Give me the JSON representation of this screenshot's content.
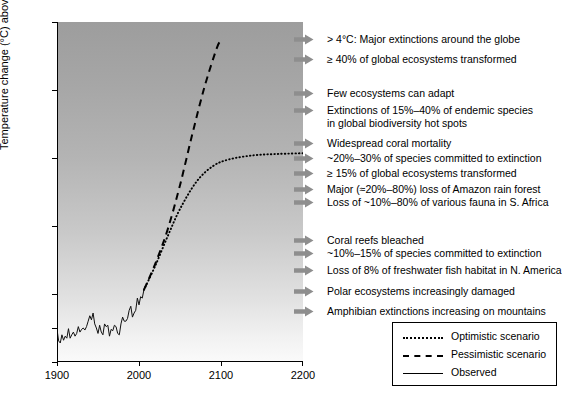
{
  "chart_data": {
    "type": "line",
    "title": "",
    "xlabel": "",
    "ylabel": "Temperature change (°C) above preindustrial",
    "xlim": [
      1900,
      2200
    ],
    "ylim": [
      -0.5,
      4.5
    ],
    "xticks": [
      "1900",
      "2000",
      "2100",
      "2200"
    ],
    "xtick_values": [
      1900,
      2000,
      2100,
      2200
    ],
    "yticks": [
      "−0.5",
      "0.0",
      "0.5",
      "1.5",
      "2.5",
      "3.5",
      "4.5"
    ],
    "ytick_values": [
      -0.5,
      0.0,
      0.5,
      1.5,
      2.5,
      3.5,
      4.5
    ],
    "grid": false,
    "legend_position": "bottom-right",
    "background": "vertical gradient, dark gray at top to white at bottom",
    "series": [
      {
        "name": "Observed",
        "style": "solid",
        "x": [
          1900,
          1902,
          1904,
          1906,
          1908,
          1910,
          1912,
          1914,
          1916,
          1918,
          1920,
          1922,
          1924,
          1926,
          1928,
          1930,
          1932,
          1934,
          1936,
          1938,
          1940,
          1942,
          1944,
          1946,
          1948,
          1950,
          1952,
          1954,
          1956,
          1958,
          1960,
          1962,
          1964,
          1966,
          1968,
          1970,
          1972,
          1974,
          1976,
          1978,
          1980,
          1982,
          1984,
          1986,
          1988,
          1990,
          1992,
          1994,
          1996,
          1998,
          2000,
          2002,
          2004,
          2006
        ],
        "values": [
          -0.02,
          -0.19,
          -0.22,
          -0.1,
          -0.18,
          -0.12,
          -0.15,
          -0.01,
          -0.15,
          -0.1,
          -0.06,
          -0.12,
          -0.08,
          0.02,
          -0.06,
          -0.02,
          0.0,
          -0.03,
          0.02,
          0.1,
          0.18,
          0.12,
          0.22,
          0.06,
          0.0,
          -0.08,
          0.04,
          -0.06,
          -0.1,
          0.06,
          0.02,
          0.04,
          -0.12,
          -0.02,
          -0.04,
          0.04,
          0.02,
          -0.08,
          -0.1,
          0.06,
          0.16,
          0.1,
          0.1,
          0.14,
          0.26,
          0.32,
          0.16,
          0.22,
          0.26,
          0.44,
          0.34,
          0.46,
          0.44,
          0.56
        ]
      },
      {
        "name": "Pessimistic scenario",
        "style": "dashed",
        "x": [
          2006,
          2020,
          2035,
          2050,
          2065,
          2080,
          2095,
          2100
        ],
        "values": [
          0.56,
          0.95,
          1.45,
          2.1,
          2.85,
          3.55,
          4.12,
          4.22
        ]
      },
      {
        "name": "Optimistic scenario",
        "style": "dotted",
        "x": [
          2006,
          2020,
          2035,
          2050,
          2070,
          2090,
          2110,
          2140,
          2170,
          2200
        ],
        "values": [
          0.56,
          0.92,
          1.35,
          1.75,
          2.15,
          2.38,
          2.48,
          2.54,
          2.56,
          2.57
        ]
      }
    ]
  },
  "yaxis": {
    "title": "Temperature change (°C) above preindustrial",
    "ticks": [
      {
        "label": "4.5",
        "value": 4.5
      },
      {
        "label": "3.5",
        "value": 3.5
      },
      {
        "label": "2.5",
        "value": 2.5
      },
      {
        "label": "1.5",
        "value": 1.5
      },
      {
        "label": "0.5",
        "value": 0.5
      },
      {
        "label": "0.0",
        "value": 0.0
      },
      {
        "label": "−0.5",
        "value": -0.5
      }
    ]
  },
  "xaxis": {
    "ticks": [
      {
        "label": "1900",
        "value": 1900
      },
      {
        "label": "2000",
        "value": 2000
      },
      {
        "label": "2100",
        "value": 2100
      },
      {
        "label": "2200",
        "value": 2200
      }
    ]
  },
  "annotations": [
    {
      "lines": [
        "> 4°C: Major extinctions around the globe"
      ],
      "temp": 4.25
    },
    {
      "lines": [
        "≥ 40% of global ecosystems transformed"
      ],
      "temp": 3.95
    },
    {
      "lines": [
        "Few ecosystems can adapt"
      ],
      "temp": 3.45
    },
    {
      "lines": [
        "Extinctions of 15%–40% of endemic species",
        "in global biodiversity hot spots"
      ],
      "temp": 3.2
    },
    {
      "lines": [
        "Widespread coral mortality"
      ],
      "temp": 2.72
    },
    {
      "lines": [
        "~20%–30% of species committed to extinction"
      ],
      "temp": 2.5
    },
    {
      "lines": [
        "≥ 15% of global ecosystems transformed"
      ],
      "temp": 2.28
    },
    {
      "lines": [
        "Major (≈20%–80%) loss of Amazon rain forest"
      ],
      "temp": 2.05
    },
    {
      "lines": [
        "Loss of ~10%–80% of various fauna in S. Africa"
      ],
      "temp": 1.85
    },
    {
      "lines": [
        "Coral reefs bleached"
      ],
      "temp": 1.3
    },
    {
      "lines": [
        "~10%–15% of species committed to extinction"
      ],
      "temp": 1.1
    },
    {
      "lines": [
        "Loss of 8% of freshwater fish habitat in N. America"
      ],
      "temp": 0.85
    },
    {
      "lines": [
        "Polar ecosystems increasingly damaged"
      ],
      "temp": 0.55
    },
    {
      "lines": [
        "Amphibian extinctions increasing on mountains"
      ],
      "temp": 0.25
    }
  ],
  "legend": {
    "items": [
      {
        "label": "Optimistic scenario",
        "style": "dotted"
      },
      {
        "label": "Pessimistic scenario",
        "style": "dashed"
      },
      {
        "label": "Observed",
        "style": "solid"
      }
    ]
  }
}
